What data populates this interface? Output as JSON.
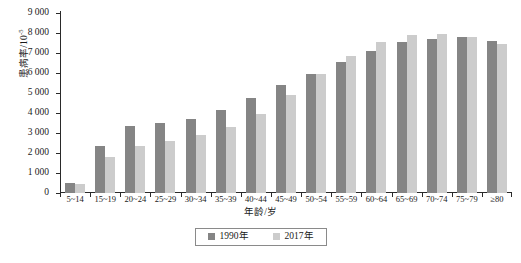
{
  "chart_data": {
    "type": "bar",
    "title": "",
    "xlabel": "年龄/岁",
    "ylabel": "患病率/10",
    "ylabel_exponent": "-5",
    "ylim": [
      0,
      9000
    ],
    "ytick_step": 1000,
    "grid": false,
    "legend_position": "bottom",
    "categories": [
      "5~14",
      "15~19",
      "20~24",
      "25~29",
      "30~34",
      "35~39",
      "40~44",
      "45~49",
      "50~54",
      "55~59",
      "60~64",
      "65~69",
      "70~74",
      "75~79",
      "≥80"
    ],
    "ytick_labels": [
      "0",
      "1 000",
      "2 000",
      "3 000",
      "4 000",
      "5 000",
      "6 000",
      "7 000",
      "8 000",
      "9 000"
    ],
    "series": [
      {
        "name": "1990年",
        "color": "#858585",
        "values": [
          500,
          2350,
          3370,
          3520,
          3700,
          4150,
          4750,
          5400,
          5950,
          6550,
          7100,
          7550,
          7700,
          7800,
          7600
        ]
      },
      {
        "name": "2017年",
        "color": "#cccccc",
        "values": [
          430,
          1800,
          2330,
          2620,
          2900,
          3300,
          3950,
          4900,
          5950,
          6850,
          7550,
          7900,
          7950,
          7800,
          7450
        ]
      }
    ]
  }
}
